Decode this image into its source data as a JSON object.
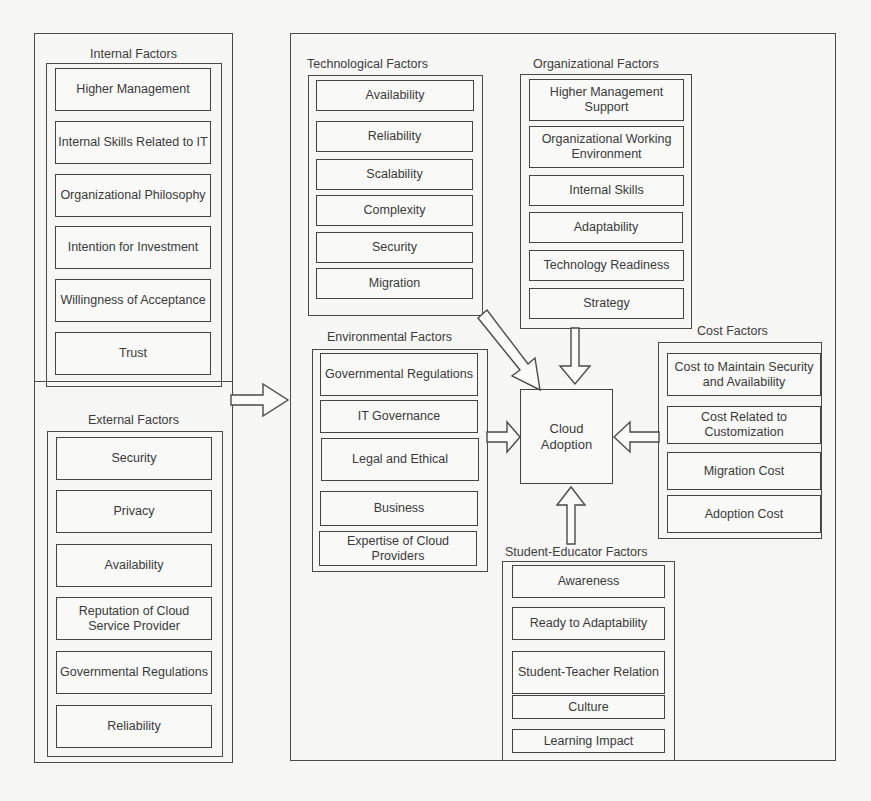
{
  "diagram": {
    "left_panel": {
      "internal": {
        "title": "Internal Factors",
        "items": [
          "Higher Management",
          "Internal Skills Related to IT",
          "Organizational Philosophy",
          "Intention for Investment",
          "Willingness of Acceptance",
          "Trust"
        ]
      },
      "external": {
        "title": "External Factors",
        "items": [
          "Security",
          "Privacy",
          "Availability",
          "Reputation of Cloud Service Provider",
          "Governmental Regulations",
          "Reliability"
        ]
      }
    },
    "right_panel": {
      "technological": {
        "title": "Technological Factors",
        "items": [
          "Availability",
          "Reliability",
          "Scalability",
          "Complexity",
          "Security",
          "Migration"
        ]
      },
      "organizational": {
        "title": "Organizational Factors",
        "items": [
          "Higher Management Support",
          "Organizational Working Environment",
          "Internal Skills",
          "Adaptability",
          "Technology Readiness",
          "Strategy"
        ]
      },
      "environmental": {
        "title": "Environmental Factors",
        "items": [
          "Governmental Regulations",
          "IT Governance",
          "Legal and Ethical",
          "Business",
          "Expertise of Cloud Providers"
        ]
      },
      "cost": {
        "title": "Cost Factors",
        "items": [
          "Cost to Maintain Security and Availability",
          "Cost Related to Customization",
          "Migration Cost",
          "Adoption Cost"
        ]
      },
      "student_educator": {
        "title": "Student-Educator Factors",
        "items": [
          "Awareness",
          "Ready to Adaptability",
          "Student-Teacher Relation",
          "Culture",
          "Learning Impact"
        ]
      },
      "center": {
        "label": "Cloud Adoption"
      }
    },
    "arrows": [
      {
        "from": "left_panel",
        "to": "right_panel",
        "icon": "arrow-right-icon"
      },
      {
        "from": "technological",
        "to": "center",
        "icon": "arrow-diagonal-icon"
      },
      {
        "from": "organizational",
        "to": "center",
        "icon": "arrow-down-icon"
      },
      {
        "from": "environmental",
        "to": "center",
        "icon": "arrow-right-icon"
      },
      {
        "from": "cost",
        "to": "center",
        "icon": "arrow-left-icon"
      },
      {
        "from": "student_educator",
        "to": "center",
        "icon": "arrow-up-icon"
      }
    ]
  }
}
